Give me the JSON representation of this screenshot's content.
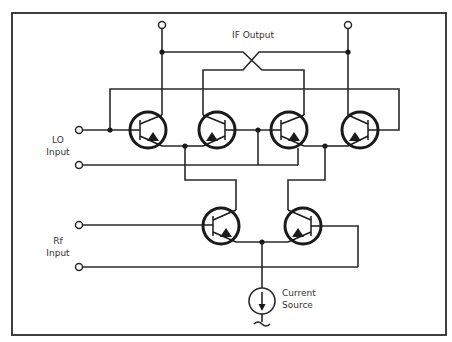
{
  "diagram": {
    "type": "Gilbert cell mixer schematic",
    "labels": {
      "if_output": "IF Output",
      "lo_input_line1": "LO",
      "lo_input_line2": "Input",
      "rf_input_line1": "Rf",
      "rf_input_line2": "Input",
      "current_source_line1": "Current",
      "current_source_line2": "Source"
    },
    "components": {
      "upper_transistors": [
        "Q1",
        "Q2",
        "Q3",
        "Q4"
      ],
      "lower_transistors": [
        "Q5",
        "Q6"
      ],
      "current_source": "I",
      "terminals": [
        "IF+",
        "IF-",
        "LO+",
        "LO-",
        "RF+",
        "RF-"
      ]
    },
    "colors": {
      "line": "#2a2a2a",
      "background": "#ffffff"
    }
  }
}
